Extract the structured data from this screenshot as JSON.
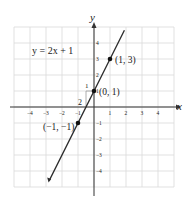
{
  "chart_data": {
    "type": "line",
    "title": "",
    "equation": "y = 2x + 1",
    "xlabel": "x",
    "ylabel": "y",
    "xlim": [
      -5,
      5
    ],
    "ylim": [
      -5,
      5
    ],
    "grid": true,
    "x_ticks": [
      "-4",
      "-3",
      "-2",
      "-1",
      "1",
      "2",
      "3",
      "4"
    ],
    "y_ticks": [
      "4",
      "3",
      "2",
      "1",
      "-1",
      "-2",
      "-3",
      "-4"
    ],
    "series": [
      {
        "name": "y = 2x + 1",
        "slope": 2,
        "intercept": 1,
        "x_range": [
          -2.8,
          1.9
        ]
      }
    ],
    "points": [
      {
        "x": 1,
        "y": 3,
        "label": "(1, 3)"
      },
      {
        "x": 0,
        "y": 1,
        "label": "(0, 1)"
      },
      {
        "x": -1,
        "y": -1,
        "label": "(−1, −1)"
      }
    ],
    "slope_triangle": {
      "run_label": "1",
      "rise_label": "2"
    },
    "colors": {
      "line": "#2b2b2b",
      "grid": "#d9d9d9",
      "axis": "#333333",
      "triangle": "#9a9a9a"
    }
  }
}
